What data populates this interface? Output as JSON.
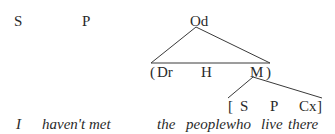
{
  "labels": {
    "subject": "S",
    "predicator": "P",
    "object": "Od"
  },
  "np_structure": {
    "open": "(",
    "determiner": "Dr",
    "head": "H",
    "modifier": "M",
    "close": ")"
  },
  "clause_structure": {
    "open": "[",
    "subject": "S",
    "predicator": "P",
    "complement": "Cx",
    "close": "]"
  },
  "sentence": {
    "w1": "I",
    "w2": "haven't met",
    "w3": "the",
    "w4": "people",
    "w5": "who",
    "w6": "live",
    "w7": "there"
  }
}
